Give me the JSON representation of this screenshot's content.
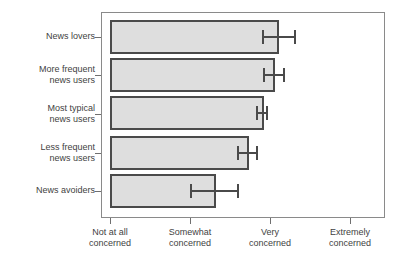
{
  "chart_data": {
    "type": "bar",
    "orientation": "horizontal",
    "title": "",
    "xlabel": "",
    "ylabel": "",
    "grid": false,
    "legend": null,
    "xlim": [
      1,
      4.5625
    ],
    "x_tick_values": [
      1,
      2,
      3,
      4
    ],
    "x_tick_labels": [
      "Not at all\nconcerned",
      "Somewhat\nconcerned",
      "Very\nconcerned",
      "Extremely\nconcerned"
    ],
    "categories": [
      "News lovers",
      "More frequent\nnews users",
      "Most typical\nnews users",
      "Less frequent\nnews users",
      "News avoiders"
    ],
    "values": [
      3.11,
      3.06,
      2.93,
      2.74,
      2.33
    ],
    "error_low": [
      2.9,
      2.91,
      2.83,
      2.59,
      2.0
    ],
    "error_high": [
      3.33,
      3.19,
      2.98,
      2.85,
      2.61
    ],
    "bar_fill": "#dedede",
    "bar_edge": "#4a4a4a",
    "error_color": "#4a4a4a",
    "frame_color": "#8a8a8a",
    "background": "#ffffff"
  },
  "axis": {
    "tick_positions_px": [
      110,
      190,
      270,
      350
    ],
    "unit_px": 80,
    "origin_px": 110
  }
}
